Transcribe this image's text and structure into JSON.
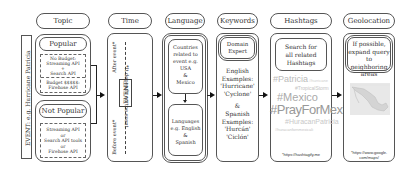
{
  "event_label": "EVENT: e.g. Hurricane Patricia",
  "columns": {
    "topic": {
      "header": "Topic",
      "popular": {
        "label": "Popular",
        "no_budget": [
          "No Budget:",
          "Streaming API",
          "+",
          "Search API"
        ],
        "budget": [
          "Budget $$$$$:",
          "Firehose API"
        ]
      },
      "not_popular": {
        "label": "Not Popular",
        "options": [
          "Streaming API",
          "or",
          "Search API tools",
          "or",
          "Firehose API"
        ]
      }
    },
    "time": {
      "header": "Time",
      "before": "Before event*",
      "event": "EVENT",
      "after": "After event*",
      "note": "*It depends on the event"
    },
    "language": {
      "header": "Language",
      "countries": [
        "Countries",
        "related to",
        "event e.g.",
        "USA",
        "&",
        "Mexico"
      ],
      "languages": [
        "Languages",
        "e.g. English",
        "&",
        "Spanish"
      ]
    },
    "keywords": {
      "header": "Keywords",
      "expert": [
        "Domain",
        "Expert"
      ],
      "english": [
        "English",
        "Examples:",
        "'Hurricane'",
        "'Cyclone'"
      ],
      "amp": "&",
      "spanish": [
        "Spanish",
        "Examples:",
        "'Hurcán'",
        "'Ciclón'"
      ]
    },
    "hashtags": {
      "header": "Hashtags",
      "search": [
        "Search for",
        "all related",
        "Hashtags"
      ],
      "cloud": [
        {
          "tag": "#Patricia",
          "size": 9,
          "color": "#bbbbbb"
        },
        {
          "tag": "#hurricane",
          "size": 4,
          "color": "#cccccc"
        },
        {
          "tag": "#TropicalStorm",
          "size": 5,
          "color": "#c4c4c4"
        },
        {
          "tag": "#Mexico",
          "size": 11,
          "color": "#aaaaaa"
        },
        {
          "tag": "#PrayForMexico",
          "size": 14,
          "color": "#999999"
        },
        {
          "tag": "#HuracanPatricia",
          "size": 7,
          "color": "#c8c8c8"
        },
        {
          "tag": "#huracanfornmexicali",
          "size": 4,
          "color": "#c4c4c4"
        }
      ],
      "source": "*https://hashtagify.me"
    },
    "geolocation": {
      "header": "Geolocation",
      "note": [
        "If possible,",
        "expand query",
        "to neighboring",
        "areas"
      ],
      "map_alt": "map-of-mexico",
      "source": [
        "*https://www.google.",
        "com/maps/"
      ]
    }
  }
}
